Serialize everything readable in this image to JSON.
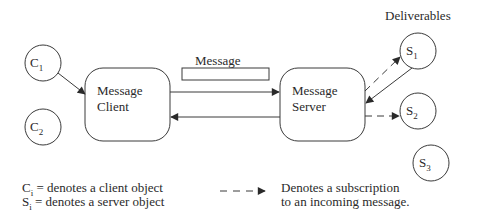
{
  "diagram": {
    "deliverables_label": "Deliverables",
    "message_label": "Message",
    "clients": [
      {
        "id": "C",
        "sub": "1"
      },
      {
        "id": "C",
        "sub": "2"
      }
    ],
    "servers": [
      {
        "id": "S",
        "sub": "1"
      },
      {
        "id": "S",
        "sub": "2"
      },
      {
        "id": "S",
        "sub": "3"
      }
    ],
    "message_client": {
      "line1": "Message",
      "line2": "Client"
    },
    "message_server": {
      "line1": "Message",
      "line2": "Server"
    }
  },
  "legend": {
    "client_def": {
      "sym": "C",
      "sub": "i",
      "text": " = denotes a client object"
    },
    "server_def": {
      "sym": "S",
      "sub": "i",
      "text": " = denotes a server object"
    },
    "subscription_line1": "Denotes a subscription",
    "subscription_line2": "to an incoming message."
  },
  "colors": {
    "stroke": "#3a3a3a",
    "text": "#2a2a2a",
    "background": "#ffffff"
  }
}
